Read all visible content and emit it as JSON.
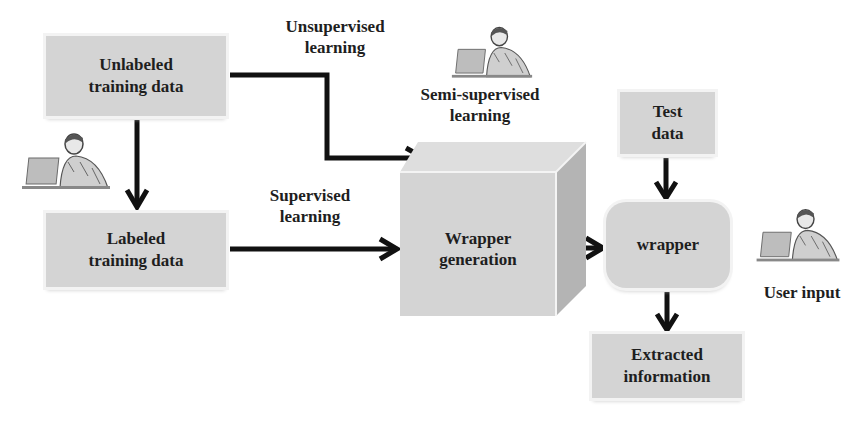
{
  "nodes": {
    "unlabeled": {
      "line1": "Unlabeled",
      "line2": "training data"
    },
    "labeled": {
      "line1": "Labeled",
      "line2": "training data"
    },
    "wrapper_generation": {
      "line1": "Wrapper",
      "line2": "generation"
    },
    "test_data": {
      "line1": "Test",
      "line2": "data"
    },
    "wrapper": {
      "line1": "wrapper"
    },
    "extracted": {
      "line1": "Extracted",
      "line2": "information"
    }
  },
  "edge_labels": {
    "unsupervised": {
      "line1": "Unsupervised",
      "line2": "learning"
    },
    "semi_supervised": {
      "line1": "Semi-supervised",
      "line2": "learning"
    },
    "supervised": {
      "line1": "Supervised",
      "line2": "learning"
    },
    "user_input": {
      "line1": "User input"
    }
  },
  "icons": {
    "person_laptop": "person-at-laptop"
  },
  "colors": {
    "box_fill": "#d4d4d4",
    "cube_top": "#dedede",
    "cube_side": "#b4b4b4",
    "arrow": "#111111",
    "text": "#1e1e1e"
  }
}
